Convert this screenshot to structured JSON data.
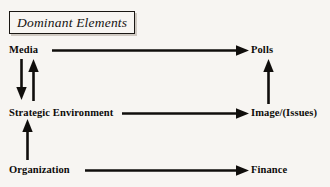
{
  "title": {
    "text": "Dominant Elements"
  },
  "nodes": [
    {
      "id": "media",
      "label": "Media",
      "column": "left",
      "row": "top"
    },
    {
      "id": "polls",
      "label": "Polls",
      "column": "right",
      "row": "top"
    },
    {
      "id": "strategic-environment",
      "label": "Strategic Environment",
      "column": "left",
      "row": "middle"
    },
    {
      "id": "image-issues",
      "label": "Image/(Issues)",
      "column": "right",
      "row": "middle"
    },
    {
      "id": "organization",
      "label": "Organization",
      "column": "left",
      "row": "bottom"
    },
    {
      "id": "finance",
      "label": "Finance",
      "column": "right",
      "row": "bottom"
    }
  ],
  "edges": [
    {
      "id": "media-to-polls",
      "from": "media",
      "to": "polls",
      "direction": "right"
    },
    {
      "id": "media-to-strategic-environment",
      "from": "media",
      "to": "strategic-environment",
      "direction": "down"
    },
    {
      "id": "strategic-environment-to-media",
      "from": "strategic-environment",
      "to": "media",
      "direction": "up"
    },
    {
      "id": "strategic-environment-to-image-issues",
      "from": "strategic-environment",
      "to": "image-issues",
      "direction": "right"
    },
    {
      "id": "image-issues-to-polls",
      "from": "image-issues",
      "to": "polls",
      "direction": "up"
    },
    {
      "id": "organization-to-strategic-environment",
      "from": "organization",
      "to": "strategic-environment",
      "direction": "up"
    },
    {
      "id": "organization-to-finance",
      "from": "organization",
      "to": "finance",
      "direction": "right"
    }
  ],
  "colors": {
    "background": "#f7f5f2",
    "stroke": "#100e0c",
    "text": "#0d0b09",
    "box_border": "#1a1713",
    "box_shadow": "#cfc9c2"
  }
}
